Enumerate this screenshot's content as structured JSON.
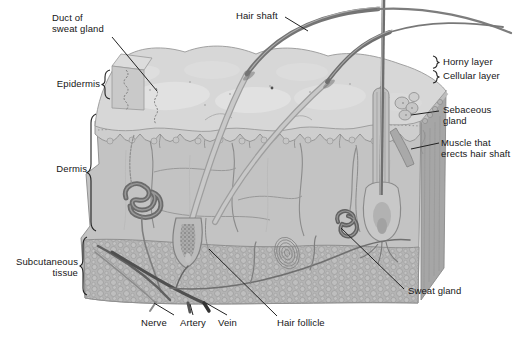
{
  "figure": {
    "labels": {
      "duct_of_sweat_gland": "Duct of\nsweat gland",
      "hair_shaft": "Hair shaft",
      "horny_layer": "Horny layer",
      "cellular_layer": "Cellular layer",
      "epidermis": "Epidermis",
      "sebaceous_gland": "Sebaceous\ngland",
      "muscle_that_erects_hair_shaft": "Muscle that\nerects hair shaft",
      "dermis": "Dermis",
      "subcutaneous_tissue": "Subcutaneous\ntissue",
      "sweat_gland": "Sweat gland",
      "nerve": "Nerve",
      "artery": "Artery",
      "vein": "Vein",
      "hair_follicle": "Hair follicle"
    },
    "colors": {
      "background": "#ffffff",
      "label_ink": "#161616",
      "leader_line": "#222222",
      "skin_surface": "#d7d7d7",
      "epidermis_layer": "#cecece",
      "dermis_layer": "#c3c3c3",
      "subcutaneous_layer": "#b4b4b4",
      "side_face": "#a6a6a6",
      "hair": "#767676"
    }
  }
}
